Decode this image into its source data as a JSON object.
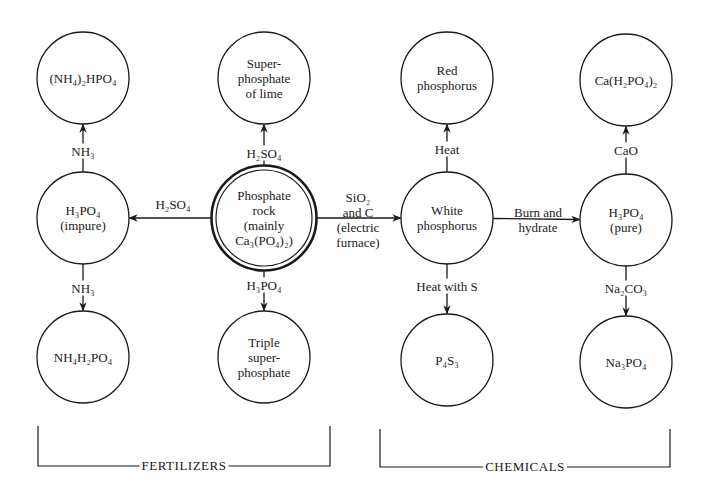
{
  "diagram": {
    "colors": {
      "stroke": "#1a1a1a",
      "background": "#ffffff"
    },
    "nodes": [
      {
        "id": "nh4_2hpo4",
        "label": "(NH4)2HPO4",
        "lines": [
          "(NH₄)₂HPO₄"
        ],
        "cx": 83,
        "cy": 78,
        "r": 46
      },
      {
        "id": "h3po4_impure",
        "label": "H3PO4 (impure)",
        "lines": [
          "H₃PO₄",
          "(impure)"
        ],
        "cx": 83,
        "cy": 218,
        "r": 46
      },
      {
        "id": "nh4h2po4",
        "label": "NH4H2PO4",
        "lines": [
          "NH₄H₂PO₄"
        ],
        "cx": 83,
        "cy": 357,
        "r": 46
      },
      {
        "id": "superphosphate_of_lime",
        "label": "Super-phosphate of lime",
        "lines": [
          "Super-",
          "phosphate",
          "of lime"
        ],
        "cx": 264,
        "cy": 78,
        "r": 46
      },
      {
        "id": "phosphate_rock",
        "label": "Phosphate rock (mainly Ca3(PO4)2)",
        "lines": [
          "Phosphate",
          "rock",
          "(mainly",
          "Ca₃(PO₄)₂)"
        ],
        "cx": 264,
        "cy": 218,
        "r": 51,
        "double": true
      },
      {
        "id": "triple_superphosphate",
        "label": "Triple super-phosphate",
        "lines": [
          "Triple",
          "super-",
          "phosphate"
        ],
        "cx": 264,
        "cy": 357,
        "r": 46
      },
      {
        "id": "red_phosphorus",
        "label": "Red phosphorus",
        "lines": [
          "Red",
          "phosphorus"
        ],
        "cx": 447,
        "cy": 78,
        "r": 46
      },
      {
        "id": "white_phosphorus",
        "label": "White phosphorus",
        "lines": [
          "White",
          "phosphorus"
        ],
        "cx": 447,
        "cy": 218,
        "r": 46
      },
      {
        "id": "p4s3",
        "label": "P4S3",
        "lines": [
          "P₄S₃"
        ],
        "cx": 447,
        "cy": 360,
        "r": 46
      },
      {
        "id": "ca_h2po4_2",
        "label": "Ca(H2PO4)2",
        "lines": [
          "Ca(H₂PO₄)₂"
        ],
        "cx": 626,
        "cy": 80,
        "r": 46
      },
      {
        "id": "h3po4_pure",
        "label": "H3PO4 (pure)",
        "lines": [
          "H₃PO₄",
          "(pure)"
        ],
        "cx": 626,
        "cy": 220,
        "r": 46
      },
      {
        "id": "na3po4",
        "label": "Na3PO4",
        "lines": [
          "Na₃PO₄"
        ],
        "cx": 626,
        "cy": 362,
        "r": 46
      }
    ],
    "edges": [
      {
        "from": "h3po4_impure",
        "to": "nh4_2hpo4",
        "reagent": [
          "NH₃"
        ],
        "lx": 83,
        "ly": 151
      },
      {
        "from": "h3po4_impure",
        "to": "nh4h2po4",
        "reagent": [
          "NH₃"
        ],
        "lx": 83,
        "ly": 288
      },
      {
        "from": "phosphate_rock",
        "to": "superphosphate_of_lime",
        "reagent": [
          "H₂SO₄"
        ],
        "lx": 264,
        "ly": 153
      },
      {
        "from": "phosphate_rock",
        "to": "h3po4_impure",
        "reagent": [
          "H₂SO₄"
        ],
        "lx": 173,
        "ly": 204
      },
      {
        "from": "phosphate_rock",
        "to": "triple_superphosphate",
        "reagent": [
          "H₃PO₄"
        ],
        "lx": 264,
        "ly": 285
      },
      {
        "from": "phosphate_rock",
        "to": "white_phosphorus",
        "reagent": [
          "SiO₂",
          "and C",
          "(electric",
          "furnace)"
        ],
        "lx": 358,
        "ly": 220
      },
      {
        "from": "white_phosphorus",
        "to": "red_phosphorus",
        "reagent": [
          "Heat"
        ],
        "lx": 447,
        "ly": 149
      },
      {
        "from": "white_phosphorus",
        "to": "p4s3",
        "reagent": [
          "Heat with S"
        ],
        "lx": 447,
        "ly": 286
      },
      {
        "from": "white_phosphorus",
        "to": "h3po4_pure",
        "reagent": [
          "Burn and",
          "hydrate"
        ],
        "lx": 538,
        "ly": 220
      },
      {
        "from": "h3po4_pure",
        "to": "ca_h2po4_2",
        "reagent": [
          "CaO"
        ],
        "lx": 626,
        "ly": 150
      },
      {
        "from": "h3po4_pure",
        "to": "na3po4",
        "reagent": [
          "Na₂CO₃"
        ],
        "lx": 626,
        "ly": 288
      }
    ],
    "groups": [
      {
        "id": "fertilizers",
        "label": "FERTILIZERS",
        "x1": 38,
        "x2": 330,
        "ytop": 426,
        "ybottom": 466
      },
      {
        "id": "chemicals",
        "label": "CHEMICALS",
        "x1": 380,
        "x2": 670,
        "ytop": 429,
        "ybottom": 467
      }
    ]
  }
}
